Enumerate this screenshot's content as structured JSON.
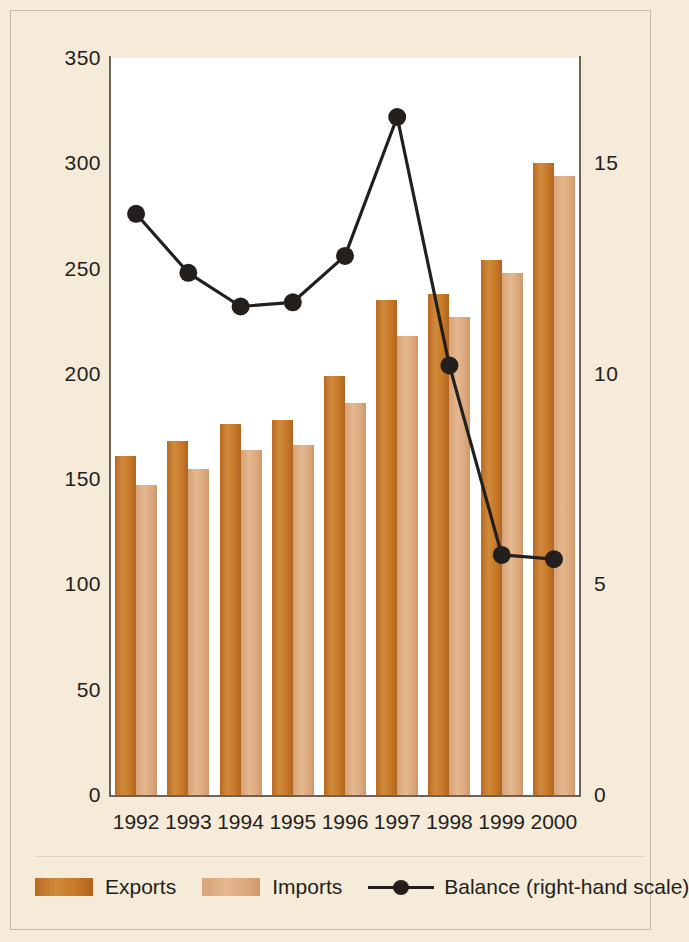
{
  "chart_data": {
    "type": "bar",
    "title": "",
    "subtitle": "",
    "xlabel": "",
    "ylabel": "",
    "categories": [
      "1992",
      "1993",
      "1994",
      "1995",
      "1996",
      "1997",
      "1998",
      "1999",
      "2000"
    ],
    "series": [
      {
        "name": "Exports",
        "axis": "left",
        "type": "bar",
        "color": "#c87a29",
        "values": [
          161,
          168,
          176,
          178,
          199,
          235,
          238,
          254,
          300
        ]
      },
      {
        "name": "Imports",
        "axis": "left",
        "type": "bar",
        "color": "#dba97f",
        "values": [
          147,
          155,
          164,
          166,
          186,
          218,
          227,
          248,
          294
        ]
      },
      {
        "name": "Balance (right-hand scale)",
        "axis": "right",
        "type": "line",
        "color": "#231f1c",
        "values": [
          13.8,
          12.4,
          11.6,
          11.7,
          12.8,
          16.1,
          10.2,
          5.7,
          5.6
        ]
      }
    ],
    "ylim": [
      0,
      350
    ],
    "yticks": [
      0,
      50,
      100,
      150,
      200,
      250,
      300,
      350
    ],
    "y2lim": [
      0,
      17.5
    ],
    "y2ticks": [
      0,
      5,
      10,
      15
    ],
    "grid": false,
    "legend_position": "bottom"
  },
  "axes": {
    "left_ticks": [
      "350",
      "300",
      "250",
      "200",
      "150",
      "100",
      "50",
      "0"
    ],
    "right_ticks": [
      "15",
      "10",
      "5",
      "0"
    ]
  },
  "legend": {
    "entries": [
      {
        "label": "Exports",
        "marker": "exports-swatch"
      },
      {
        "label": "Imports",
        "marker": "imports-swatch"
      },
      {
        "label": "Balance (right-hand scale)",
        "marker": "balance-line-marker"
      }
    ]
  }
}
